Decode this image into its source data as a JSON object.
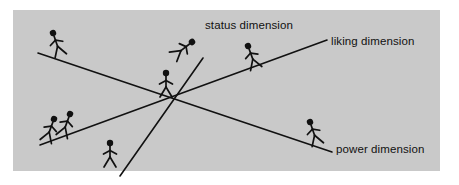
{
  "figure": {
    "name": "interpersonal-dimensions-diagram",
    "panel": {
      "x": 13,
      "y": 10,
      "width": 427,
      "height": 161,
      "background_color": "#c9c9c9"
    },
    "outer_background_color": "#ffffff",
    "ink_color": "#111111"
  },
  "labels": {
    "status": "status dimension",
    "liking": "liking dimension",
    "power": "power dimension"
  },
  "axes": [
    {
      "id": "status-power-axis",
      "label": "power dimension",
      "description": "line descending from upper-left to lower-right",
      "x1": 38,
      "y1": 53,
      "x2": 332,
      "y2": 152
    },
    {
      "id": "liking-axis",
      "label": "liking dimension",
      "description": "line ascending from lower-left to upper-right",
      "x1": 40,
      "y1": 145,
      "x2": 327,
      "y2": 40
    },
    {
      "id": "status-axis",
      "label": "status dimension",
      "description": "steep line ascending from bottom-center to upper-center",
      "x1": 120,
      "y1": 175,
      "x2": 203,
      "y2": 58
    }
  ],
  "intersection": {
    "x": 167,
    "y": 98
  },
  "figures": [
    {
      "id": "figure-upper-left",
      "head_x": 53,
      "head_y": 33,
      "feet_y": 57,
      "on_axis": "status-power-axis",
      "tilt": -19
    },
    {
      "id": "figure-upper-center",
      "head_x": 192,
      "head_y": 42,
      "feet_y": 66,
      "on_axis": "status-axis",
      "tilt": 54
    },
    {
      "id": "figure-upper-right",
      "head_x": 248,
      "head_y": 46,
      "feet_y": 70,
      "on_axis": "liking-axis",
      "tilt": -20
    },
    {
      "id": "figure-center",
      "head_x": 163,
      "head_y": 72,
      "feet_y": 97,
      "on_axis": "intersection",
      "tilt": 0
    },
    {
      "id": "figure-lower-left-a",
      "head_x": 54,
      "head_y": 119,
      "feet_y": 143,
      "on_axis": "liking-axis",
      "tilt": 20
    },
    {
      "id": "figure-lower-left-b",
      "head_x": 70,
      "head_y": 114,
      "feet_y": 138,
      "on_axis": "liking-axis",
      "tilt": 20
    },
    {
      "id": "figure-bottom-center",
      "head_x": 110,
      "head_y": 143,
      "feet_y": 167,
      "on_axis": "none",
      "tilt": 0
    },
    {
      "id": "figure-lower-right",
      "head_x": 310,
      "head_y": 122,
      "feet_y": 146,
      "on_axis": "status-power-axis",
      "tilt": -19
    }
  ]
}
